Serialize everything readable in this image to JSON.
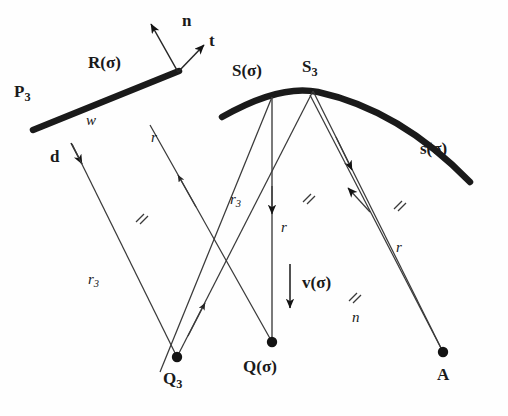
{
  "figure": {
    "type": "geometry-diagram",
    "background_color": "#fefefe",
    "ink_color": "#1a1a1a",
    "width": 508,
    "height": 416
  },
  "labels": {
    "n_vector": "n",
    "t_vector": "t",
    "R_sigma": "R(σ)",
    "P_3": "P",
    "P_3_sub": "3",
    "w": "w",
    "d": "d",
    "r_left": "r",
    "r3_left": "r",
    "r3_left_sub": "3",
    "S_sigma": "S(σ)",
    "S_3": "S",
    "S_3_sub": "3",
    "s_sigma": "s(σ)",
    "r3_mid": "r",
    "r3_mid_sub": "3",
    "r_mid": "r",
    "v_sigma": "v(σ)",
    "r_right": "r",
    "n_italic": "n",
    "Q_3": "Q",
    "Q_3_sub": "3",
    "Q_sigma": "Q(σ)",
    "A": "A"
  },
  "points": {
    "R_sigma": {
      "x": 126,
      "y": 91
    },
    "P_3": {
      "x": 33,
      "y": 130
    },
    "line_end": {
      "x": 179,
      "y": 71
    },
    "S_sigma": {
      "x": 272,
      "y": 97
    },
    "S_3": {
      "x": 313,
      "y": 90
    },
    "Q_3": {
      "x": 177,
      "y": 357
    },
    "Q_sigma": {
      "x": 272,
      "y": 342
    },
    "A": {
      "x": 443,
      "y": 352
    }
  },
  "tick_marks": [
    {
      "name": "tick-left",
      "x": 140,
      "y": 218
    },
    {
      "name": "tick-mid",
      "x": 307,
      "y": 198
    },
    {
      "name": "tick-right",
      "x": 398,
      "y": 205
    },
    {
      "name": "tick-lower",
      "x": 353,
      "y": 297
    }
  ]
}
